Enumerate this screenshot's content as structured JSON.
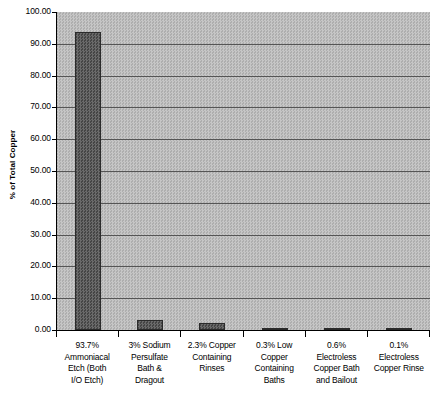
{
  "chart_data": {
    "type": "bar",
    "title": "",
    "subtitle": "",
    "xlabel": "",
    "ylabel": "% of Total Copper",
    "ylim": [
      0,
      100
    ],
    "ytick_step": 10,
    "grid": true,
    "legend": false,
    "orientation": "vertical",
    "categories": [
      "93.7% Ammoniacal Etch (Both I/O Etch)",
      "3% Sodium Persulfate Bath & Dragout",
      "2.3% Copper Containing Rinses",
      "0.3% Low Copper Containing Baths",
      "0.6% Electroless Copper Bath and Bailout",
      "0.1% Electroless Copper Rinse"
    ],
    "values": [
      93.7,
      3.0,
      2.3,
      0.3,
      0.6,
      0.1
    ],
    "ytick_labels": [
      "100.00",
      "90.00",
      "80.00",
      "70.00",
      "60.00",
      "50.00",
      "40.00",
      "30.00",
      "20.00",
      "10.00",
      "0.00"
    ],
    "ytick_values": [
      100,
      90,
      80,
      70,
      60,
      50,
      40,
      30,
      20,
      10,
      0
    ],
    "category_lines": [
      [
        "93.7%",
        "Ammoniacal",
        "Etch (Both",
        "I/O Etch)"
      ],
      [
        "3% Sodium",
        "Persulfate",
        "Bath &",
        "Dragout"
      ],
      [
        "2.3% Copper",
        "Containing",
        "Rinses"
      ],
      [
        "0.3% Low",
        "Copper",
        "Containing",
        "Baths"
      ],
      [
        "0.6%",
        "Electroless",
        "Copper Bath",
        "and Bailout"
      ],
      [
        "0.1%",
        "Electroless",
        "Copper Rinse"
      ]
    ],
    "colors": {
      "bar_fill": "#575757",
      "bar_border": "#2b2b2b",
      "plot_background": "#b9b9b9",
      "gridline": "#555555",
      "axis": "#000000",
      "text": "#000000",
      "page_background": "#ffffff"
    }
  }
}
